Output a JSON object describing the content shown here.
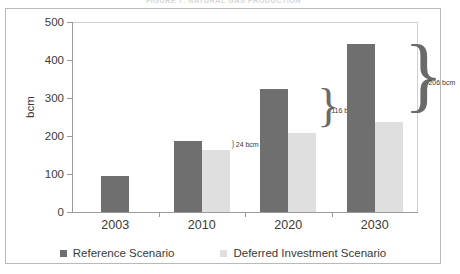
{
  "figure": {
    "title": "FIGURE 7: NATURAL GAS PRODUCTION"
  },
  "chart_data": {
    "type": "bar",
    "title": "",
    "xlabel": "",
    "ylabel": "bcm",
    "ylim": [
      0,
      500
    ],
    "yticks": [
      0,
      100,
      200,
      300,
      400,
      500
    ],
    "ytick_labels": [
      "0",
      "100",
      "200",
      "300",
      "400",
      "500"
    ],
    "grid": false,
    "legend_position": "bottom",
    "categories": [
      "2003",
      "2010",
      "2020",
      "2030"
    ],
    "series": [
      {
        "name": "Reference Scenario",
        "color": "#6f6f6f",
        "values": [
          96,
          188,
          325,
          442
        ]
      },
      {
        "name": "Deferred Investment Scenario",
        "color": "#dfdfdf",
        "values": [
          null,
          164,
          209,
          236
        ]
      }
    ],
    "annotations": [
      {
        "label": "24 bcm",
        "category": "2010",
        "gap": 24
      },
      {
        "label": "116 bcm",
        "category": "2020",
        "gap": 116
      },
      {
        "label": "206 bcm",
        "category": "2030",
        "gap": 206
      }
    ]
  },
  "legend": {
    "items": [
      {
        "label": "Reference Scenario",
        "color": "#6f6f6f"
      },
      {
        "label": "Deferred Investment Scenario",
        "color": "#dfdfdf"
      }
    ]
  },
  "axis": {
    "y_title": "bcm"
  }
}
